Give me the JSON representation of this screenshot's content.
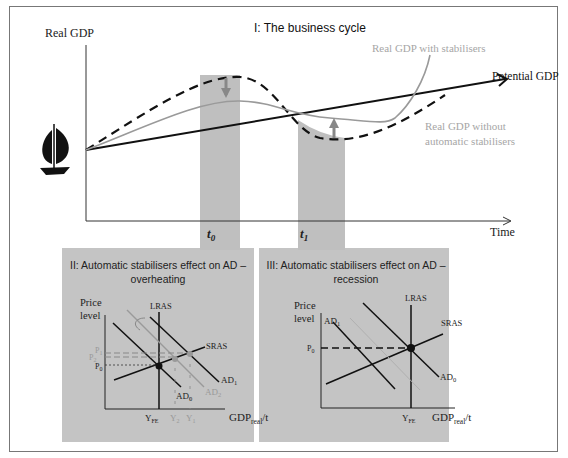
{
  "panel1": {
    "title": "I: The business cycle",
    "y_axis_label": "Real GDP",
    "x_axis_label": "Time",
    "labels": {
      "potential": "Potential GDP",
      "with_stabilisers": "Real GDP with stabilisers",
      "without_line1": "Real GDP without",
      "without_line2": "automatic stabilisers"
    },
    "t0": "t",
    "t0_sub": "0",
    "t1": "t",
    "t1_sub": "1",
    "icon": "sailboat-icon"
  },
  "panel2": {
    "title_line1": "II: Automatic stabilisers effect on AD –",
    "title_line2": "overheating",
    "y_label_1": "Price",
    "y_label_2": "level",
    "x_label": "GDP",
    "x_label_sub": "real",
    "x_label_tail": "/t",
    "lras": "LRAS",
    "sras": "SRAS",
    "ad0": "AD",
    "ad0_sub": "0",
    "ad1": "AD",
    "ad1_sub": "1",
    "ad2": "AD",
    "ad2_sub": "2",
    "p0": "P",
    "p0_sub": "0",
    "p1": "P",
    "p1_sub": "1",
    "p2": "P",
    "p2_sub": "2",
    "yfe": "Y",
    "yfe_sub": "FE",
    "y1": "Y",
    "y1_sub": "1",
    "y2": "Y",
    "y2_sub": "2"
  },
  "panel3": {
    "title_line1": "III: Automatic stabilisers effect on AD –",
    "title_line2": "recession",
    "y_label_1": "Price",
    "y_label_2": "level",
    "x_label": "GDP",
    "x_label_sub": "real",
    "x_label_tail": "/t",
    "lras": "LRAS",
    "sras": "SRAS",
    "ad0": "AD",
    "ad0_sub": "0",
    "ad1": "AD",
    "ad1_sub": "1",
    "p0": "P",
    "p0_sub": "0",
    "yfe": "Y",
    "yfe_sub": "FE"
  },
  "colors": {
    "panel_bg": "#c4c4c4",
    "band": "#bdbdbd",
    "gray_curve": "#9a9a9a",
    "gray_text": "#a6a6a6",
    "black": "#111111"
  }
}
